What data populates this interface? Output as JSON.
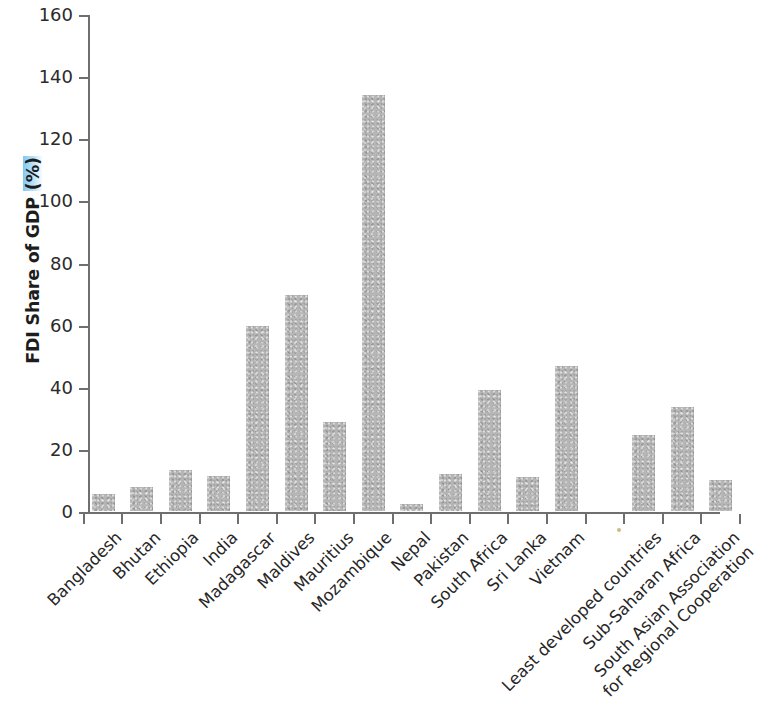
{
  "chart_data": {
    "type": "bar",
    "title": "",
    "xlabel": "",
    "ylabel": "FDI Share of GDP (%)",
    "ylim": [
      0,
      160
    ],
    "ytick_values": [
      0,
      20,
      40,
      60,
      80,
      100,
      120,
      140,
      160
    ],
    "ytick_labels": [
      "0",
      "20",
      "40",
      "60",
      "80",
      "100",
      "120",
      "140",
      "160"
    ],
    "grid": false,
    "legend": "none",
    "bar_color": "#b6b6b6",
    "axis_color": "#6f6f6f",
    "text_color": "#262626",
    "categories": [
      "Bangladesh",
      "Bhutan",
      "Ethiopia",
      "India",
      "Madagascar",
      "Maldives",
      "Mauritius",
      "Mozambique",
      "Nepal",
      "Pakistan",
      "South Africa",
      "Sri Lanka",
      "Vietnam",
      "",
      "Least developed countries",
      "Sub-Saharan Africa",
      "South Asian Association for Regional Cooperation"
    ],
    "values": [
      5.5,
      7.8,
      13.3,
      11.3,
      59.5,
      69.5,
      28.8,
      134.0,
      2.3,
      12.0,
      38.8,
      11.0,
      46.8,
      null,
      24.6,
      33.5,
      10.0
    ],
    "label_lines": [
      [
        "Bangladesh"
      ],
      [
        "Bhutan"
      ],
      [
        "Ethiopia"
      ],
      [
        "India"
      ],
      [
        "Madagascar"
      ],
      [
        "Maldives"
      ],
      [
        "Mauritius"
      ],
      [
        "Mozambique"
      ],
      [
        "Nepal"
      ],
      [
        "Pakistan"
      ],
      [
        "South Africa"
      ],
      [
        "Sri Lanka"
      ],
      [
        "Vietnam"
      ],
      [
        ""
      ],
      [
        "Least developed countries"
      ],
      [
        "Sub-Saharan Africa"
      ],
      [
        "South Asian Association",
        "for Regional Cooperation"
      ]
    ]
  },
  "axis_title": {
    "prefix": "FDI Share of GDP ",
    "highlight": "(%)"
  }
}
